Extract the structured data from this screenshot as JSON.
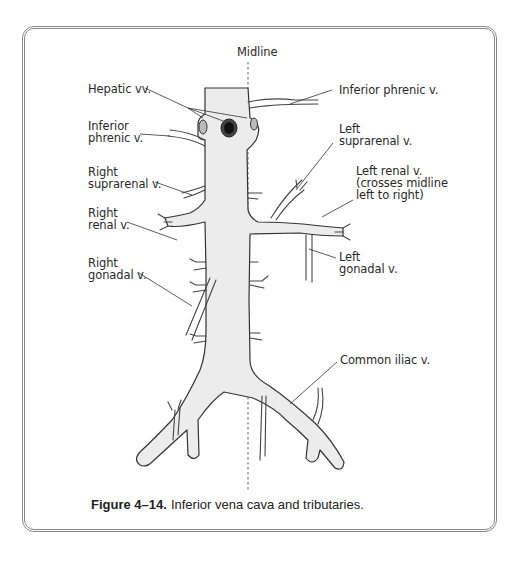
{
  "figure": {
    "number_label": "Figure 4–14.",
    "caption_text": "Inferior vena cava and tributaries.",
    "midline_label": "Midline"
  },
  "labels": {
    "hepatic_vv": "Hepatic vv.",
    "right_inferior_phrenic": "Inferior\nphrenic v.",
    "right_suprarenal": "Right\nsuprarenal v.",
    "right_renal": "Right\nrenal v.",
    "right_gonadal": "Right\ngonadal v.",
    "left_inferior_phrenic": "Inferior phrenic v.",
    "left_suprarenal": "Left\nsuprarenal v.",
    "left_renal": "Left renal v.\n(crosses midline\nleft to right)",
    "left_gonadal": "Left\ngonadal v.",
    "common_iliac": "Common iliac v."
  },
  "colors": {
    "vessel_fill": "#ececec",
    "vessel_stroke": "#333333",
    "frame": "#8a8a8a",
    "text": "#2a2a2a"
  }
}
